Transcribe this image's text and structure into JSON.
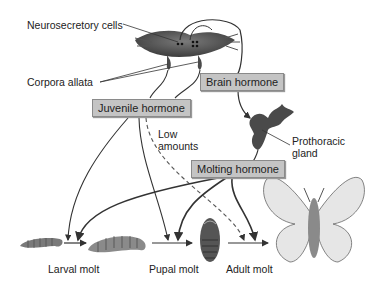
{
  "diagram": {
    "labels": {
      "neurosecretory_cells": "Neurosecretory cells",
      "corpora_allata": "Corpora allata",
      "prothoracic_gland_line1": "Prothoracic",
      "prothoracic_gland_line2": "gland",
      "low_amounts_line1": "Low",
      "low_amounts_line2": "amounts"
    },
    "hormone_boxes": {
      "brain_hormone": "Brain hormone",
      "juvenile_hormone": "Juvenile hormone",
      "molting_hormone": "Molting hormone"
    },
    "stages": {
      "larval_molt": "Larval molt",
      "pupal_molt": "Pupal molt",
      "adult_molt": "Adult molt"
    },
    "colors": {
      "box_fill": "#c4c4c4",
      "line": "#333333",
      "organ": "#4a4a4a"
    }
  }
}
